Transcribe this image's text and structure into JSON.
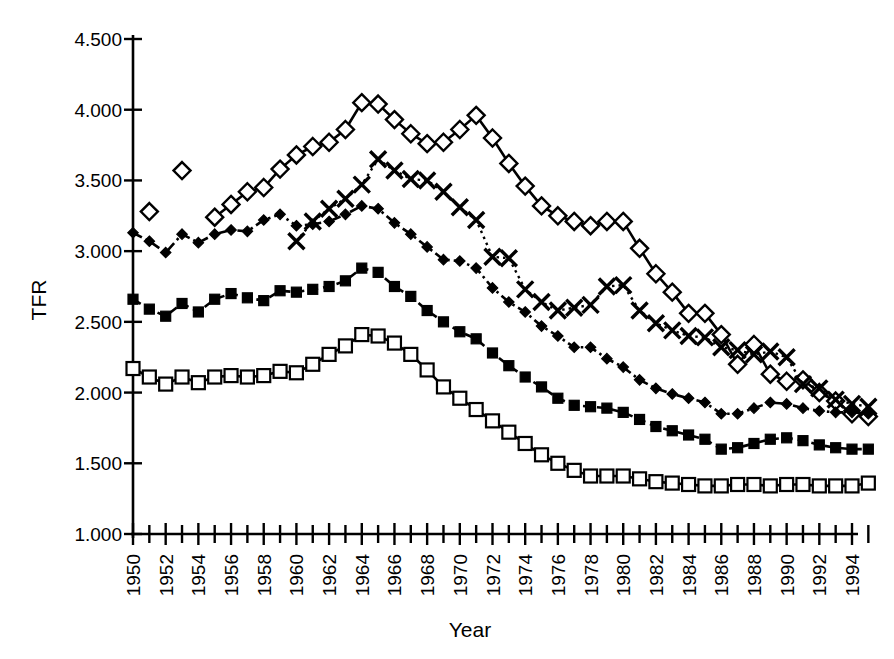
{
  "chart_data": {
    "type": "line",
    "title": "",
    "xlabel": "Year",
    "ylabel": "TFR",
    "xlim": [
      1950,
      1995
    ],
    "ylim": [
      1.0,
      4.5
    ],
    "ytick_labels": [
      "4.500",
      "4.000",
      "3.500",
      "3.000",
      "2.500",
      "2.000",
      "1.500",
      "1.000"
    ],
    "ytick_values": [
      4.5,
      4.0,
      3.5,
      3.0,
      2.5,
      2.0,
      1.5,
      1.0
    ],
    "xtick_labels": [
      "1950",
      "1952",
      "1954",
      "1956",
      "1958",
      "1960",
      "1962",
      "1964",
      "1966",
      "1968",
      "1970",
      "1972",
      "1974",
      "1976",
      "1978",
      "1980",
      "1982",
      "1984",
      "1986",
      "1988",
      "1990",
      "1992",
      "1994"
    ],
    "xtick_values": [
      1950,
      1952,
      1954,
      1956,
      1958,
      1960,
      1962,
      1964,
      1966,
      1968,
      1970,
      1972,
      1974,
      1976,
      1978,
      1980,
      1982,
      1984,
      1986,
      1988,
      1990,
      1992,
      1994
    ],
    "xtick_minor_values": [
      1951,
      1953,
      1955,
      1957,
      1959,
      1961,
      1963,
      1965,
      1967,
      1969,
      1971,
      1973,
      1975,
      1977,
      1979,
      1981,
      1983,
      1985,
      1987,
      1989,
      1991,
      1993,
      1995
    ],
    "grid": false,
    "legend": "none",
    "series": [
      {
        "name": "open-diamond-series",
        "marker": "open-diamond",
        "linestyle": "solid",
        "x": [
          1951,
          1953
        ],
        "values": [
          3.28,
          3.57
        ],
        "connected": false
      },
      {
        "name": "open-diamond-series-main",
        "marker": "open-diamond",
        "linestyle": "solid",
        "x": [
          1955,
          1956,
          1957,
          1958,
          1959,
          1960,
          1961,
          1962,
          1963,
          1964,
          1965,
          1966,
          1967,
          1968,
          1969,
          1970,
          1971,
          1972,
          1973,
          1974,
          1975,
          1976,
          1977,
          1978,
          1979,
          1980,
          1981,
          1982,
          1983,
          1984,
          1985,
          1986,
          1987,
          1988,
          1989,
          1990,
          1991,
          1992,
          1993,
          1994,
          1995
        ],
        "values": [
          3.24,
          3.33,
          3.42,
          3.45,
          3.58,
          3.68,
          3.74,
          3.77,
          3.86,
          4.05,
          4.04,
          3.93,
          3.83,
          3.76,
          3.77,
          3.86,
          3.96,
          3.8,
          3.62,
          3.46,
          3.32,
          3.25,
          3.21,
          3.18,
          3.21,
          3.21,
          3.02,
          2.84,
          2.71,
          2.56,
          2.56,
          2.41,
          2.2,
          2.34,
          2.13,
          2.08,
          2.09,
          2.0,
          1.94,
          1.85,
          1.83
        ],
        "connected": true
      },
      {
        "name": "cross-series",
        "marker": "cross",
        "linestyle": "dotted",
        "x": [
          1960,
          1961,
          1962,
          1963,
          1964,
          1965,
          1966,
          1967,
          1968,
          1969,
          1970,
          1971,
          1972,
          1973,
          1974,
          1975,
          1976,
          1977,
          1978,
          1979,
          1980,
          1981,
          1982,
          1983,
          1984,
          1985,
          1986,
          1987,
          1988,
          1989,
          1990,
          1991,
          1992,
          1993,
          1994,
          1995
        ],
        "values": [
          3.07,
          3.21,
          3.3,
          3.37,
          3.47,
          3.65,
          3.57,
          3.51,
          3.5,
          3.42,
          3.31,
          3.22,
          2.96,
          2.95,
          2.73,
          2.64,
          2.58,
          2.6,
          2.62,
          2.75,
          2.76,
          2.58,
          2.49,
          2.44,
          2.4,
          2.39,
          2.32,
          2.3,
          2.27,
          2.29,
          2.25,
          2.06,
          2.03,
          1.95,
          1.92,
          1.9
        ],
        "connected": true
      },
      {
        "name": "filled-diamond-series",
        "marker": "filled-diamond",
        "linestyle": "dashdot",
        "x": [
          1950,
          1951,
          1952,
          1953,
          1954,
          1955,
          1956,
          1957,
          1958,
          1959,
          1960,
          1961,
          1962,
          1963,
          1964,
          1965,
          1966,
          1967,
          1968,
          1969,
          1970,
          1971,
          1972,
          1973,
          1974,
          1975,
          1976,
          1977,
          1978,
          1979,
          1980,
          1981,
          1982,
          1983,
          1984,
          1985,
          1986,
          1987,
          1988,
          1989,
          1990,
          1991,
          1992,
          1993,
          1994,
          1995
        ],
        "values": [
          3.13,
          3.07,
          2.99,
          3.12,
          3.06,
          3.12,
          3.15,
          3.14,
          3.22,
          3.26,
          3.18,
          3.19,
          3.21,
          3.26,
          3.32,
          3.3,
          3.2,
          3.12,
          3.03,
          2.94,
          2.93,
          2.88,
          2.74,
          2.64,
          2.57,
          2.47,
          2.4,
          2.32,
          2.32,
          2.24,
          2.18,
          2.09,
          2.03,
          1.99,
          1.96,
          1.93,
          1.85,
          1.85,
          1.89,
          1.93,
          1.92,
          1.89,
          1.87,
          1.86,
          1.86,
          1.85
        ],
        "connected": true
      },
      {
        "name": "filled-square-series",
        "marker": "filled-square",
        "linestyle": "dashed",
        "x": [
          1950,
          1951,
          1952,
          1953,
          1954,
          1955,
          1956,
          1957,
          1958,
          1959,
          1960,
          1961,
          1962,
          1963,
          1964,
          1965,
          1966,
          1967,
          1968,
          1969,
          1970,
          1971,
          1972,
          1973,
          1974,
          1975,
          1976,
          1977,
          1978,
          1979,
          1980,
          1981,
          1982,
          1983,
          1984,
          1985,
          1986,
          1987,
          1988,
          1989,
          1990,
          1991,
          1992,
          1993,
          1994,
          1995
        ],
        "values": [
          2.66,
          2.59,
          2.54,
          2.63,
          2.57,
          2.66,
          2.7,
          2.67,
          2.65,
          2.72,
          2.71,
          2.73,
          2.75,
          2.79,
          2.88,
          2.85,
          2.75,
          2.68,
          2.58,
          2.5,
          2.43,
          2.38,
          2.28,
          2.19,
          2.11,
          2.04,
          1.96,
          1.91,
          1.9,
          1.89,
          1.86,
          1.81,
          1.76,
          1.73,
          1.7,
          1.67,
          1.6,
          1.61,
          1.64,
          1.67,
          1.68,
          1.66,
          1.63,
          1.61,
          1.6,
          1.6
        ],
        "connected": true
      },
      {
        "name": "open-square-series",
        "marker": "open-square",
        "linestyle": "solid",
        "x": [
          1950,
          1951,
          1952,
          1953,
          1954,
          1955,
          1956,
          1957,
          1958,
          1959,
          1960,
          1961,
          1962,
          1963,
          1964,
          1965,
          1966,
          1967,
          1968,
          1969,
          1970,
          1971,
          1972,
          1973,
          1974,
          1975,
          1976,
          1977,
          1978,
          1979,
          1980,
          1981,
          1982,
          1983,
          1984,
          1985,
          1986,
          1987,
          1988,
          1989,
          1990,
          1991,
          1992,
          1993,
          1994,
          1995
        ],
        "values": [
          2.17,
          2.11,
          2.06,
          2.11,
          2.07,
          2.11,
          2.12,
          2.11,
          2.12,
          2.15,
          2.14,
          2.2,
          2.27,
          2.33,
          2.41,
          2.4,
          2.35,
          2.27,
          2.16,
          2.04,
          1.96,
          1.88,
          1.8,
          1.72,
          1.64,
          1.56,
          1.5,
          1.45,
          1.41,
          1.41,
          1.41,
          1.39,
          1.37,
          1.36,
          1.35,
          1.34,
          1.34,
          1.35,
          1.35,
          1.34,
          1.35,
          1.35,
          1.34,
          1.34,
          1.34,
          1.36
        ],
        "connected": true
      }
    ]
  },
  "axes": {
    "y_title": "TFR",
    "x_title": "Year"
  }
}
